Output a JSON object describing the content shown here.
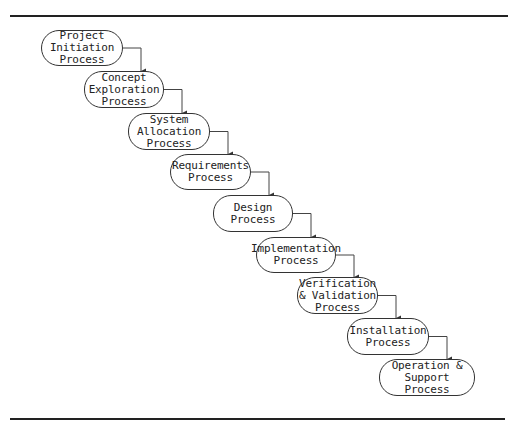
{
  "diagram": {
    "type": "waterfall-process-flow",
    "steps": [
      {
        "label": "Project\nInitiation\nProcess",
        "x": 41,
        "y": 30,
        "w": 82,
        "h": 36
      },
      {
        "label": "Concept\nExploration\nProcess",
        "x": 84,
        "y": 71,
        "w": 80,
        "h": 37
      },
      {
        "label": "System\nAllocation\nProcess",
        "x": 128,
        "y": 113,
        "w": 82,
        "h": 37
      },
      {
        "label": "Requirements\nProcess",
        "x": 170,
        "y": 154,
        "w": 81,
        "h": 36
      },
      {
        "label": "Design\nProcess",
        "x": 213,
        "y": 195,
        "w": 80,
        "h": 37
      },
      {
        "label": "Implementation\nProcess",
        "x": 256,
        "y": 237,
        "w": 80,
        "h": 36
      },
      {
        "label": "Verification\n& Validation\nProcess",
        "x": 297,
        "y": 277,
        "w": 81,
        "h": 37
      },
      {
        "label": "Installation\nProcess",
        "x": 347,
        "y": 318,
        "w": 82,
        "h": 37
      },
      {
        "label": "Operation &\nSupport Process",
        "x": 379,
        "y": 359,
        "w": 96,
        "h": 37
      }
    ],
    "colors": {
      "line": "#333333",
      "text": "#222222",
      "background": "#ffffff"
    }
  }
}
